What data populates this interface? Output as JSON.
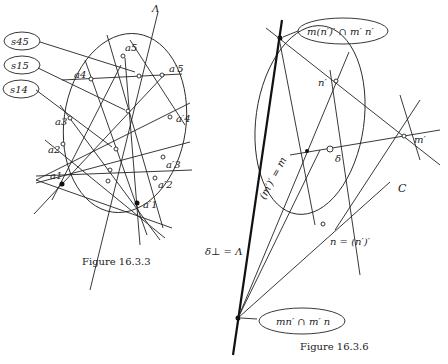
{
  "figures": [
    {
      "id": "fig-16-3-3",
      "caption": "Figure 16.3.3",
      "axis_label": "Λ",
      "callouts": [
        {
          "text": "s45"
        },
        {
          "text": "s15"
        },
        {
          "text": "s14"
        }
      ],
      "points_left": [
        "a5",
        "a4",
        "a3",
        "a2",
        "a1"
      ],
      "points_right": [
        "a′5",
        "a′4",
        "a′3",
        "a′2",
        "a′1"
      ]
    },
    {
      "id": "fig-16-3-6",
      "caption": "Figure 16.3.6",
      "callouts": [
        {
          "text": "m(n′)′ ∩ m′ n′"
        },
        {
          "text": "mn′ ∩ m′ n"
        }
      ],
      "labels": {
        "n_prime": "n′",
        "m_prime": "m′",
        "delta": "δ",
        "conic": "C",
        "n_eq": "n = (n′)′",
        "m_eq": "(m′)′ = m",
        "delta_perp": "δ⊥ = Λ"
      }
    }
  ]
}
